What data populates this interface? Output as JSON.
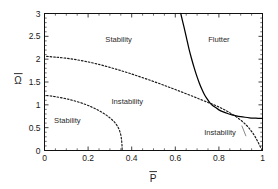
{
  "chart_data": {
    "type": "line",
    "title": "",
    "subtitle": "",
    "xlabel": "P̄",
    "ylabel": "Ω̄",
    "xlabel_base": "P",
    "ylabel_base": "Ω",
    "xlim": [
      0,
      1
    ],
    "ylim": [
      0,
      3
    ],
    "xticks": [
      0,
      0.2,
      0.4,
      0.6,
      0.8,
      1
    ],
    "yticks": [
      0,
      0.5,
      1,
      1.5,
      2,
      2.5,
      3
    ],
    "xticklabels": [
      "0",
      "0.2",
      "0.4",
      "0.6",
      "0.8",
      "1"
    ],
    "yticklabels": [
      "0",
      "0.5",
      "1",
      "1.5",
      "2",
      "2.5",
      "3"
    ],
    "x_minor_step": 0.05,
    "y_minor_step": 0.1,
    "grid": false,
    "legend": "none",
    "frame": true,
    "series": [
      {
        "name": "flutter-boundary",
        "style": "solid",
        "color": "#000000",
        "points": [
          [
            0.625,
            3.0
          ],
          [
            0.64,
            2.7
          ],
          [
            0.652,
            2.45
          ],
          [
            0.663,
            2.22
          ],
          [
            0.674,
            2.02
          ],
          [
            0.686,
            1.82
          ],
          [
            0.698,
            1.64
          ],
          [
            0.71,
            1.48
          ],
          [
            0.722,
            1.34
          ],
          [
            0.734,
            1.22
          ],
          [
            0.746,
            1.13
          ],
          [
            0.758,
            1.05
          ],
          [
            0.77,
            0.99
          ],
          [
            0.785,
            0.94
          ],
          [
            0.8,
            0.89
          ],
          [
            0.82,
            0.845
          ],
          [
            0.84,
            0.81
          ],
          [
            0.86,
            0.782
          ],
          [
            0.88,
            0.76
          ],
          [
            0.9,
            0.742
          ],
          [
            0.92,
            0.728
          ],
          [
            0.94,
            0.717
          ],
          [
            0.96,
            0.71
          ],
          [
            0.98,
            0.705
          ],
          [
            1.0,
            0.702
          ]
        ]
      },
      {
        "name": "upper-divergence-boundary",
        "style": "dashed",
        "color": "#1a1a1a",
        "points": [
          [
            0.01,
            2.06
          ],
          [
            0.05,
            2.045
          ],
          [
            0.1,
            2.02
          ],
          [
            0.15,
            1.985
          ],
          [
            0.2,
            1.94
          ],
          [
            0.25,
            1.885
          ],
          [
            0.3,
            1.82
          ],
          [
            0.35,
            1.75
          ],
          [
            0.4,
            1.675
          ],
          [
            0.45,
            1.595
          ],
          [
            0.5,
            1.512
          ],
          [
            0.55,
            1.425
          ],
          [
            0.6,
            1.335
          ],
          [
            0.65,
            1.243
          ],
          [
            0.7,
            1.148
          ],
          [
            0.75,
            1.052
          ],
          [
            0.78,
            0.995
          ],
          [
            0.81,
            0.93
          ],
          [
            0.84,
            0.855
          ],
          [
            0.87,
            0.768
          ],
          [
            0.9,
            0.665
          ],
          [
            0.925,
            0.558
          ],
          [
            0.945,
            0.45
          ],
          [
            0.962,
            0.335
          ],
          [
            0.975,
            0.225
          ],
          [
            0.985,
            0.13
          ],
          [
            0.993,
            0.055
          ],
          [
            0.998,
            0.01
          ]
        ]
      },
      {
        "name": "lower-divergence-boundary",
        "style": "dashed",
        "color": "#1a1a1a",
        "points": [
          [
            0.01,
            1.205
          ],
          [
            0.04,
            1.185
          ],
          [
            0.07,
            1.162
          ],
          [
            0.1,
            1.132
          ],
          [
            0.13,
            1.097
          ],
          [
            0.16,
            1.055
          ],
          [
            0.19,
            1.005
          ],
          [
            0.215,
            0.955
          ],
          [
            0.24,
            0.898
          ],
          [
            0.262,
            0.84
          ],
          [
            0.282,
            0.78
          ],
          [
            0.3,
            0.715
          ],
          [
            0.315,
            0.65
          ],
          [
            0.328,
            0.58
          ],
          [
            0.338,
            0.505
          ],
          [
            0.345,
            0.425
          ],
          [
            0.35,
            0.34
          ],
          [
            0.353,
            0.25
          ],
          [
            0.355,
            0.155
          ],
          [
            0.356,
            0.06
          ],
          [
            0.356,
            0.005
          ]
        ]
      }
    ],
    "annotations": [
      {
        "name": "stability-upper",
        "text": "Stability",
        "x": 0.34,
        "y": 2.38
      },
      {
        "name": "flutter",
        "text": "Flutter",
        "x": 0.8,
        "y": 2.38
      },
      {
        "name": "instability-middle",
        "text": "Instability",
        "x": 0.38,
        "y": 1.02
      },
      {
        "name": "stability-lower-left",
        "text": "Stability",
        "x": 0.105,
        "y": 0.6
      },
      {
        "name": "instability-lower-right",
        "text": "Instability",
        "x": 0.805,
        "y": 0.335,
        "leader": true,
        "leader_to_x": 0.905,
        "leader_to_y": 0.545
      }
    ]
  }
}
